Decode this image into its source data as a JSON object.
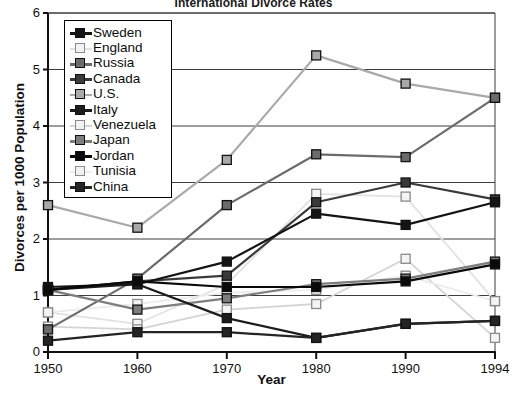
{
  "chart_data": {
    "type": "line",
    "title": "International Divorce Rates",
    "xlabel": "Year",
    "ylabel": "Divorces per 1000 Population",
    "categories": [
      "1950",
      "1960",
      "1970",
      "1980",
      "1990",
      "1994"
    ],
    "x": [
      1950,
      1960,
      1970,
      1980,
      1990,
      1994
    ],
    "xlim": [
      1950,
      1994
    ],
    "ylim": [
      0,
      6
    ],
    "yticks": [
      0,
      1,
      2,
      3,
      4,
      5,
      6
    ],
    "grid": true,
    "legend_position": "top-left inside plot",
    "series": [
      {
        "name": "Sweden",
        "values": [
          1.15,
          1.2,
          1.6,
          2.45,
          2.25,
          2.65
        ],
        "color": "#141414",
        "marker": "filled-square"
      },
      {
        "name": "England",
        "values": [
          0.7,
          0.5,
          1.2,
          2.8,
          2.75,
          0.9
        ],
        "color": "#e2e2e2",
        "marker": "open-square"
      },
      {
        "name": "Russia",
        "values": [
          0.4,
          1.3,
          2.6,
          3.5,
          3.45,
          4.5
        ],
        "color": "#6b6b6b",
        "marker": "filled-square"
      },
      {
        "name": "Canada",
        "values": [
          1.1,
          1.25,
          1.35,
          2.65,
          3.0,
          2.7
        ],
        "color": "#3a3a3a",
        "marker": "filled-square"
      },
      {
        "name": "U.S.",
        "values": [
          2.6,
          2.2,
          3.4,
          5.25,
          4.75,
          4.5
        ],
        "color": "#a9a9a9",
        "marker": "filled-square"
      },
      {
        "name": "Italy",
        "values": [
          1.1,
          1.2,
          0.6,
          0.25,
          0.5,
          0.55
        ],
        "color": "#1c1c1c",
        "marker": "filled-square"
      },
      {
        "name": "Venezuela",
        "values": [
          0.45,
          0.4,
          0.75,
          0.85,
          1.65,
          0.25
        ],
        "color": "#d4d4d4",
        "marker": "open-square"
      },
      {
        "name": "Japan",
        "values": [
          1.1,
          0.75,
          0.95,
          1.2,
          1.3,
          1.6
        ],
        "color": "#7d7d7d",
        "marker": "filled-square"
      },
      {
        "name": "Jordan",
        "values": [
          1.1,
          1.25,
          1.15,
          1.15,
          1.25,
          1.55
        ],
        "color": "#0a0a0a",
        "marker": "filled-square"
      },
      {
        "name": "Tunisia",
        "values": [
          0.7,
          0.85,
          1.05,
          1.1,
          1.35,
          0.9
        ],
        "color": "#ececec",
        "marker": "open-square"
      },
      {
        "name": "China",
        "values": [
          0.2,
          0.35,
          0.35,
          0.25,
          0.5,
          0.55
        ],
        "color": "#242424",
        "marker": "filled-square"
      }
    ]
  },
  "axes": {
    "y_tick_labels": [
      "6",
      "5",
      "4",
      "3",
      "2",
      "1",
      "0"
    ],
    "x_tick_labels": [
      "1950",
      "1960",
      "1970",
      "1980",
      "1990",
      "1994"
    ]
  },
  "legend": {
    "items": [
      {
        "label": "Sweden"
      },
      {
        "label": "England"
      },
      {
        "label": "Russia"
      },
      {
        "label": "Canada"
      },
      {
        "label": "U.S."
      },
      {
        "label": "Italy"
      },
      {
        "label": "Venezuela"
      },
      {
        "label": "Japan"
      },
      {
        "label": "Jordan"
      },
      {
        "label": "Tunisia"
      },
      {
        "label": "China"
      }
    ]
  }
}
